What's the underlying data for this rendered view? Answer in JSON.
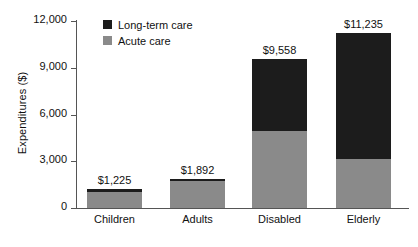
{
  "chart_data": {
    "type": "bar",
    "subtype": "stacked-bar",
    "title": "",
    "xlabel": "",
    "ylabel": "Expenditures ($)",
    "ylim": [
      0,
      12000
    ],
    "yticks": [
      0,
      3000,
      6000,
      9000,
      12000
    ],
    "ytick_labels": [
      "0",
      "3,000",
      "6,000",
      "9,000",
      "12,000"
    ],
    "grid": false,
    "legend_position": "top-left-inside",
    "categories": [
      "Children",
      "Adults",
      "Disabled",
      "Elderly"
    ],
    "series": [
      {
        "name": "Acute care",
        "color": "#8a8a8a",
        "values": [
          1035,
          1742,
          4940,
          3145
        ]
      },
      {
        "name": "Long-term care",
        "color": "#1c1c1c",
        "values": [
          190,
          150,
          4618,
          8090
        ]
      }
    ],
    "totals": [
      1225,
      1892,
      9558,
      11235
    ],
    "total_labels": [
      "$1,225",
      "$1,892",
      "$9,558",
      "$11,235"
    ]
  },
  "legend": {
    "items": [
      {
        "label": "Long-term care",
        "swatch": "legend-swatch-long-term-care"
      },
      {
        "label": "Acute care",
        "swatch": "legend-swatch-acute-care"
      }
    ]
  },
  "axes": {
    "y_title": "Expenditures ($)"
  }
}
